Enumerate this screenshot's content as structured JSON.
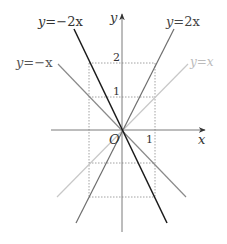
{
  "figure": {
    "type": "function-graph",
    "axes": {
      "x_label": "x",
      "y_label": "y",
      "origin_label": "O",
      "x_ticks": [
        {
          "value": 1,
          "label": "1"
        }
      ],
      "y_ticks": [
        {
          "value": 1,
          "label": "1"
        },
        {
          "value": 2,
          "label": "2"
        }
      ]
    },
    "lines": [
      {
        "id": "neg2x",
        "label_lhs": "y",
        "label_eq": "=",
        "label_rhs": "−2x",
        "label": "y=−2x",
        "slope": -2,
        "color": "#1a1a1a"
      },
      {
        "id": "negx",
        "label_lhs": "y",
        "label_eq": "=",
        "label_rhs": "−x",
        "label": "y=−x",
        "slope": -1,
        "color": "#8a8a8a"
      },
      {
        "id": "pos2x",
        "label_lhs": "y",
        "label_eq": "=",
        "label_rhs": "2x",
        "label": "y=2x",
        "slope": 2,
        "color": "#6e6e6e"
      },
      {
        "id": "posx",
        "label_lhs": "y",
        "label_eq": "=",
        "label_rhs": "x",
        "label": "y=x",
        "slope": 1,
        "color": "#c4c4c4"
      }
    ],
    "guides": {
      "dotted_x": [
        -1,
        1
      ],
      "dotted_y": [
        -2,
        -1,
        1,
        2
      ],
      "color": "#8a8a8a"
    },
    "colors": {
      "axis": "#7a7a7a",
      "text": "#333333"
    }
  }
}
